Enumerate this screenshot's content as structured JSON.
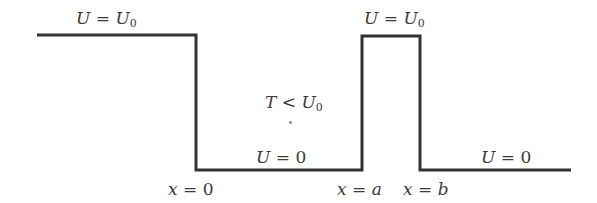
{
  "diagram": {
    "line_color": "#333333",
    "regions": [
      {
        "name": "left-plateau",
        "potential": "U0"
      },
      {
        "name": "well",
        "potential": "0"
      },
      {
        "name": "barrier",
        "potential": "U0"
      },
      {
        "name": "right-region",
        "potential": "0"
      }
    ],
    "labels": {
      "left_plateau": {
        "var": "U",
        "eq": " = ",
        "rhs": "U",
        "sub": "0"
      },
      "barrier_top": {
        "var": "U",
        "eq": " = ",
        "rhs": "U",
        "sub": "0"
      },
      "well_energy": {
        "var": "T",
        "eq": " < ",
        "rhs": "U",
        "sub": "0"
      },
      "well_floor": {
        "var": "U",
        "eq": " = ",
        "rhs": "0"
      },
      "right_floor": {
        "var": "U",
        "eq": " = ",
        "rhs": "0"
      },
      "x0": {
        "var": "x",
        "eq": " = ",
        "rhs": "0"
      },
      "xa": {
        "var": "x",
        "eq": " = ",
        "rhs": "a"
      },
      "xb": {
        "var": "x",
        "eq": " = ",
        "rhs": "b"
      }
    }
  }
}
